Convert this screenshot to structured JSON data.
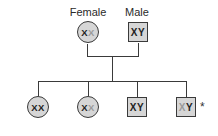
{
  "parents": {
    "female": {
      "label": "Female",
      "chromosomes": [
        "X",
        "X"
      ],
      "faint": [
        false,
        true
      ]
    },
    "male": {
      "label": "Male",
      "chromosomes": [
        "X",
        "Y"
      ],
      "faint": [
        false,
        false
      ]
    }
  },
  "children": [
    {
      "sex": "female",
      "chromosomes": [
        "X",
        "X"
      ],
      "faint": [
        false,
        false
      ]
    },
    {
      "sex": "female",
      "chromosomes": [
        "X",
        "X"
      ],
      "faint": [
        false,
        true
      ]
    },
    {
      "sex": "male",
      "chromosomes": [
        "X",
        "Y"
      ],
      "faint": [
        false,
        false
      ]
    },
    {
      "sex": "male",
      "chromosomes": [
        "X",
        "Y"
      ],
      "faint": [
        true,
        false
      ],
      "marker": "*"
    }
  ],
  "colors": {
    "fill": "#d6d6d6",
    "stroke": "#3a3a3a",
    "faint_chromosome": "#9a9a9a"
  }
}
